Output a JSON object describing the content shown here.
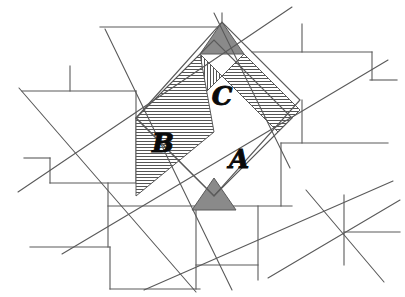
{
  "figure": {
    "canvas": {
      "width": 405,
      "height": 297
    },
    "background_color": "#ffffff",
    "line_color": "#5a5a5a",
    "hatch_color": "#555555",
    "solid_shade_color": "#8a8a8a",
    "label_color": "#0a0a0a"
  },
  "labels": {
    "square_a": "A",
    "square_b": "B",
    "square_c": "C"
  },
  "label_positions": {
    "square_a": {
      "x": 239,
      "y": 168
    },
    "square_b": {
      "x": 163,
      "y": 152
    },
    "square_c": {
      "x": 222,
      "y": 105
    }
  },
  "regions": {
    "square_a": {
      "name": "square-a",
      "fill_pattern": "vertical-hatch",
      "points": "136,118 222,22 300,100 214,196"
    },
    "square_b": {
      "name": "square-b",
      "fill_pattern": "horizontal-hatch",
      "points": "136,118 214,196 292,118 214,40"
    },
    "square_c": {
      "name": "square-c",
      "fill_pattern": "horizontal-hatch",
      "points": "222,22 300,100 214,196 136,118"
    }
  },
  "shaded_triangles": [
    {
      "name": "upper-dark-triangle",
      "points": "200,54 222,22 244,54",
      "fill": "#8a8a8a"
    },
    {
      "name": "lower-dark-triangle",
      "points": "192,210 214,178 236,210",
      "fill": "#8a8a8a"
    }
  ],
  "hatched_panels": [
    {
      "name": "panel-vertical-left",
      "pattern": "vertical-hatch",
      "points": "136,118 200,54 222,76 158,140"
    },
    {
      "name": "panel-horizontal-upper-right",
      "pattern": "horizontal-hatch",
      "points": "222,76 244,54 300,110 278,132"
    },
    {
      "name": "panel-horizontal-mid-left",
      "pattern": "horizontal-hatch",
      "points": "136,118 200,54 214,132 136,196"
    },
    {
      "name": "panel-vertical-lower-right",
      "pattern": "vertical-hatch",
      "points": "214,196 236,174 300,110 278,132"
    }
  ],
  "brick_grid_lines": [
    {
      "name": "grid-h-1",
      "x1": 100,
      "y1": 27,
      "x2": 222,
      "y2": 27
    },
    {
      "name": "grid-h-2",
      "x1": 22,
      "y1": 91,
      "x2": 136,
      "y2": 91
    },
    {
      "name": "grid-h-3",
      "x1": 252,
      "y1": 52,
      "x2": 372,
      "y2": 52
    },
    {
      "name": "grid-h-4",
      "x1": 24,
      "y1": 158,
      "x2": 50,
      "y2": 158
    },
    {
      "name": "grid-h-5",
      "x1": 50,
      "y1": 183,
      "x2": 136,
      "y2": 183
    },
    {
      "name": "grid-h-6",
      "x1": 281,
      "y1": 143,
      "x2": 388,
      "y2": 143
    },
    {
      "name": "grid-h-7",
      "x1": 370,
      "y1": 80,
      "x2": 397,
      "y2": 80
    },
    {
      "name": "grid-h-8",
      "x1": 30,
      "y1": 247,
      "x2": 110,
      "y2": 247
    },
    {
      "name": "grid-h-9",
      "x1": 110,
      "y1": 289,
      "x2": 200,
      "y2": 289
    },
    {
      "name": "grid-h-10",
      "x1": 196,
      "y1": 206,
      "x2": 292,
      "y2": 206
    },
    {
      "name": "grid-h-11",
      "x1": 344,
      "y1": 232,
      "x2": 400,
      "y2": 232
    },
    {
      "name": "grid-h-12",
      "x1": 196,
      "y1": 265,
      "x2": 258,
      "y2": 265
    },
    {
      "name": "grid-h-13",
      "x1": 108,
      "y1": 206,
      "x2": 196,
      "y2": 206
    },
    {
      "name": "grid-v-1",
      "x1": 70,
      "y1": 66,
      "x2": 70,
      "y2": 91
    },
    {
      "name": "grid-v-2",
      "x1": 136,
      "y1": 91,
      "x2": 136,
      "y2": 183
    },
    {
      "name": "grid-v-3",
      "x1": 222,
      "y1": 13,
      "x2": 222,
      "y2": 27
    },
    {
      "name": "grid-v-4",
      "x1": 302,
      "y1": 24,
      "x2": 302,
      "y2": 52
    },
    {
      "name": "grid-v-5",
      "x1": 372,
      "y1": 52,
      "x2": 372,
      "y2": 80
    },
    {
      "name": "grid-v-6",
      "x1": 50,
      "y1": 158,
      "x2": 50,
      "y2": 183
    },
    {
      "name": "grid-v-7",
      "x1": 108,
      "y1": 183,
      "x2": 108,
      "y2": 247
    },
    {
      "name": "grid-v-8",
      "x1": 281,
      "y1": 143,
      "x2": 281,
      "y2": 206
    },
    {
      "name": "grid-v-9",
      "x1": 344,
      "y1": 195,
      "x2": 344,
      "y2": 265
    },
    {
      "name": "grid-v-10",
      "x1": 196,
      "y1": 206,
      "x2": 196,
      "y2": 289
    },
    {
      "name": "grid-v-11",
      "x1": 258,
      "y1": 206,
      "x2": 258,
      "y2": 280
    },
    {
      "name": "grid-v-12",
      "x1": 110,
      "y1": 247,
      "x2": 110,
      "y2": 289
    },
    {
      "name": "grid-v-13",
      "x1": 302,
      "y1": 100,
      "x2": 302,
      "y2": 143
    }
  ],
  "construction_lines": [
    {
      "name": "diag-down-right-1",
      "x1": 105,
      "y1": 29,
      "x2": 232,
      "y2": 290
    },
    {
      "name": "diag-down-right-2",
      "x1": 19,
      "y1": 88,
      "x2": 196,
      "y2": 292
    },
    {
      "name": "diag-up-right-1",
      "x1": 18,
      "y1": 192,
      "x2": 292,
      "y2": 7
    },
    {
      "name": "diag-up-right-2",
      "x1": 62,
      "y1": 254,
      "x2": 388,
      "y2": 60
    },
    {
      "name": "diag-up-right-3",
      "x1": 144,
      "y1": 290,
      "x2": 393,
      "y2": 181
    },
    {
      "name": "diag-down-right-3",
      "x1": 214,
      "y1": 13,
      "x2": 290,
      "y2": 168
    },
    {
      "name": "diag-down-right-4",
      "x1": 306,
      "y1": 190,
      "x2": 384,
      "y2": 282
    },
    {
      "name": "diag-down-right-5",
      "x1": 268,
      "y1": 278,
      "x2": 400,
      "y2": 200
    }
  ]
}
